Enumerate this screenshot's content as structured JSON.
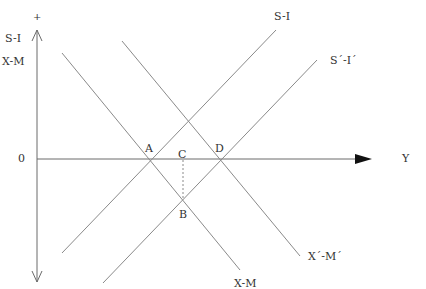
{
  "diagram": {
    "axes": {
      "y_axis_top_sign": "+",
      "y_axis_label_1": "S-I",
      "y_axis_label_2": "X-M",
      "origin_label": "0",
      "x_axis_label": "Y"
    },
    "curves": {
      "s_i": "S-I",
      "s_i_prime": "S´-I´",
      "x_m": "X-M",
      "x_m_prime": "X´-M´"
    },
    "points": {
      "a": "A",
      "b": "B",
      "c": "C",
      "d": "D"
    },
    "colors": {
      "line": "#8a8a8a",
      "axis": "#6a6a6a",
      "arrow": "#111111",
      "text": "#333333"
    }
  }
}
